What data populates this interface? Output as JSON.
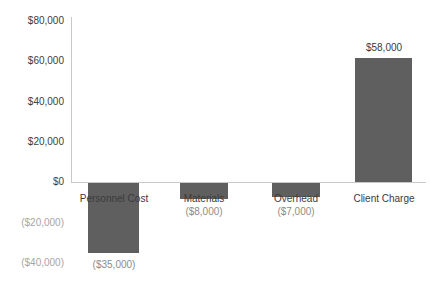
{
  "chart_data": {
    "type": "bar",
    "title": "",
    "xlabel": "",
    "ylabel": "",
    "categories": [
      "Personnel Cost",
      "Materials",
      "Overhead",
      "Client Charge"
    ],
    "values": [
      -35000,
      -8000,
      -7000,
      58000
    ],
    "data_labels": [
      "($35,000)",
      "($8,000)",
      "($7,000)",
      "$58,000"
    ],
    "ylim": [
      -40000,
      80000
    ],
    "yticks": [
      80000,
      60000,
      40000,
      20000,
      0,
      -20000,
      -40000
    ],
    "ytick_labels": [
      "$80,000",
      "$60,000",
      "$40,000",
      "$20,000",
      "$0",
      "($20,000)",
      "($40,000)"
    ],
    "grid": false,
    "legend": false,
    "bar_color": "#5f5f5f",
    "axis_color": "#c9c9c9",
    "label_color": "#3a3a3a",
    "negative_label_color": "#8c8c8c"
  },
  "axis": {
    "ticks": [
      {
        "label": "$80,000",
        "negative": false,
        "top": 15
      },
      {
        "label": "$60,000",
        "negative": false,
        "top": 55
      },
      {
        "label": "$40,000",
        "negative": false,
        "top": 96
      },
      {
        "label": "$20,000",
        "negative": false,
        "top": 136
      },
      {
        "label": "$0",
        "negative": false,
        "top": 176
      },
      {
        "label": "($20,000)",
        "negative": true,
        "top": 217
      },
      {
        "label": "($40,000)",
        "negative": true,
        "top": 257
      }
    ]
  },
  "bars": [
    {
      "category": "Personnel Cost",
      "value": -35000,
      "value_label": "($35,000)",
      "negative": true,
      "left": 88,
      "width": 51,
      "bar_top": 183,
      "bar_height": 70,
      "cat_label_left": 70,
      "cat_label_top": 193,
      "cat_label_width": 88,
      "val_label_left": 70,
      "val_label_top": 259,
      "val_label_width": 88
    },
    {
      "category": "Materials",
      "value": -8000,
      "value_label": "($8,000)",
      "negative": true,
      "left": 180,
      "width": 48,
      "bar_top": 183,
      "bar_height": 16,
      "cat_label_left": 163,
      "cat_label_top": 193,
      "cat_label_width": 82,
      "val_label_left": 163,
      "val_label_top": 206,
      "val_label_width": 82
    },
    {
      "category": "Overhead",
      "value": -7000,
      "value_label": "($7,000)",
      "negative": true,
      "left": 272,
      "width": 48,
      "bar_top": 183,
      "bar_height": 14,
      "cat_label_left": 255,
      "cat_label_top": 193,
      "cat_label_width": 82,
      "val_label_left": 255,
      "val_label_top": 206,
      "val_label_width": 82
    },
    {
      "category": "Client Charge",
      "value": 58000,
      "value_label": "$58,000",
      "negative": false,
      "left": 355,
      "width": 57,
      "bar_top": 58,
      "bar_height": 124,
      "cat_label_left": 340,
      "cat_label_top": 193,
      "cat_label_width": 88,
      "val_label_left": 340,
      "val_label_top": 42,
      "val_label_width": 88
    }
  ]
}
